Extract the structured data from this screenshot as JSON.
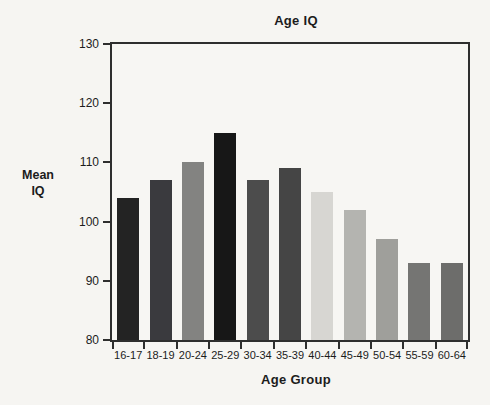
{
  "chart_data": {
    "type": "bar",
    "title": "Age IQ",
    "xlabel": "Age Group",
    "ylabel_lines": [
      "Mean",
      "IQ"
    ],
    "categories": [
      "16-17",
      "18-19",
      "20-24",
      "25-29",
      "30-34",
      "35-39",
      "40-44",
      "45-49",
      "50-54",
      "55-59",
      "60-64"
    ],
    "values": [
      104,
      107,
      110,
      115,
      107,
      109,
      105,
      102,
      97,
      93,
      93
    ],
    "bar_colors": [
      "#232323",
      "#3a3a3e",
      "#838381",
      "#171717",
      "#4c4c4c",
      "#454545",
      "#d7d6d2",
      "#b4b4b0",
      "#9f9f9b",
      "#757573",
      "#6d6d6b"
    ],
    "ylim": [
      80,
      130
    ],
    "yticks": [
      80,
      90,
      100,
      110,
      120,
      130
    ],
    "grid": false,
    "legend": false,
    "frame_color": "#2e2e2e",
    "background_color": "#f6f5f2"
  }
}
